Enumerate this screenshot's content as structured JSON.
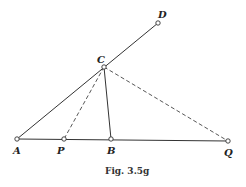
{
  "figure": {
    "caption": "Fig. 3.5g",
    "points": {
      "A": {
        "label": "A",
        "x": 17,
        "y": 139
      },
      "P": {
        "label": "P",
        "x": 64,
        "y": 139
      },
      "B": {
        "label": "B",
        "x": 111,
        "y": 139
      },
      "Q": {
        "label": "Q",
        "x": 228,
        "y": 141
      },
      "C": {
        "label": "C",
        "x": 104,
        "y": 67
      },
      "D": {
        "label": "D",
        "x": 158,
        "y": 23
      }
    },
    "segments": [
      {
        "from": "A",
        "to": "Q",
        "style": "solid"
      },
      {
        "from": "A",
        "to": "D",
        "style": "solid"
      },
      {
        "from": "C",
        "to": "B",
        "style": "solid"
      },
      {
        "from": "C",
        "to": "P",
        "style": "dashed"
      },
      {
        "from": "C",
        "to": "Q",
        "style": "dashed"
      }
    ]
  }
}
